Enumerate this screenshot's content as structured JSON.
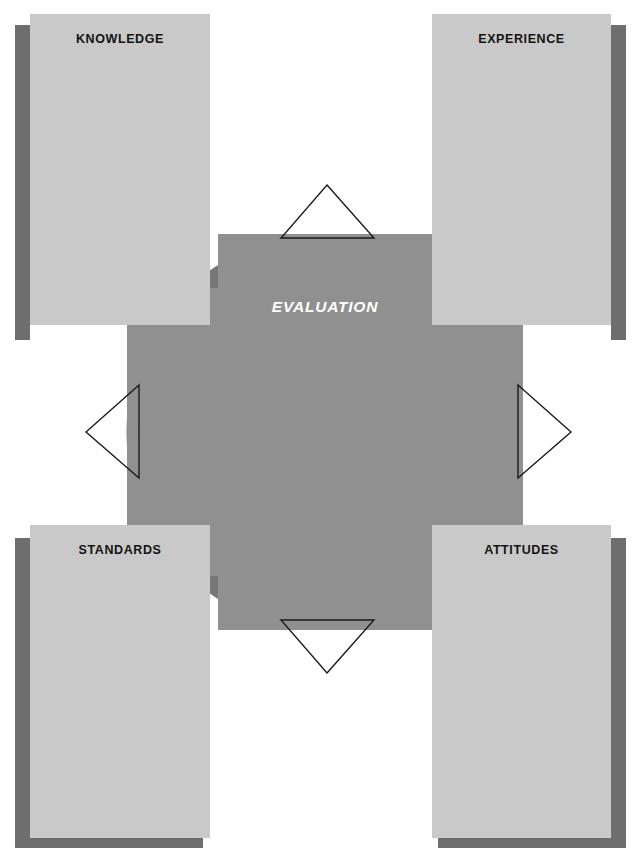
{
  "diagram": {
    "center": {
      "label": "EVALUATION"
    },
    "quadrants": [
      {
        "id": "knowledge",
        "label": "KNOWLEDGE",
        "position": "top-left"
      },
      {
        "id": "experience",
        "label": "EXPERIENCE",
        "position": "top-right"
      },
      {
        "id": "standards",
        "label": "STANDARDS",
        "position": "bottom-left"
      },
      {
        "id": "attitudes",
        "label": "ATTITUDES",
        "position": "bottom-right"
      }
    ],
    "connectors": [
      {
        "id": "connector-top",
        "direction": "up",
        "shape": "triangle-outline"
      },
      {
        "id": "connector-right",
        "direction": "right",
        "shape": "triangle-outline"
      },
      {
        "id": "connector-bottom",
        "direction": "down",
        "shape": "triangle-outline"
      },
      {
        "id": "connector-left",
        "direction": "left",
        "shape": "triangle-outline"
      }
    ],
    "colors": {
      "background": "#ffffff",
      "circle_dark": "#777777",
      "cross_light": "#909090",
      "box_face": "#c9c9c9",
      "box_shadow": "#6e6e6e",
      "label_text": "#141414",
      "center_text": "#ffffff",
      "connector_stroke": "#1a1a1a"
    }
  }
}
